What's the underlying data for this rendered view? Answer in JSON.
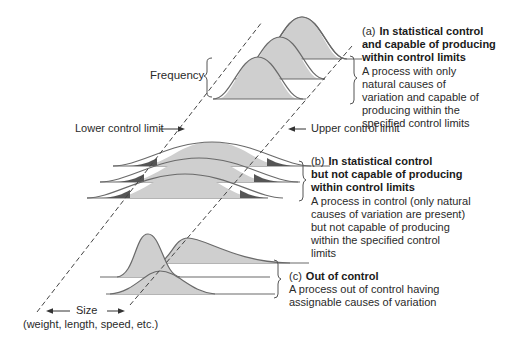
{
  "diagram": {
    "frequency_label": "Frequency",
    "lower_limit_label": "Lower control limit",
    "upper_limit_label": "Upper control limit",
    "size_label": "Size",
    "size_sublabel": "(weight, length, speed, etc.)",
    "colors": {
      "curve_fill": "#cfcfcf",
      "curve_stroke": "#6a6a6a",
      "tail_fill": "#555555",
      "dashed_line": "#444444",
      "text": "#2a2a2a"
    }
  },
  "cases": [
    {
      "tag": "(a)",
      "title": "In statistical control and capable of producing within control limits",
      "title_lines": [
        "In statistical control",
        "and capable of producing",
        "within control limits"
      ],
      "description_lines": [
        "A process with only",
        "natural causes of",
        "variation and capable of",
        "producing within the",
        "specified control limits"
      ]
    },
    {
      "tag": "(b)",
      "title": "In statistical control but not capable of producing within control limits",
      "title_lines": [
        "In statistical control",
        "but not capable of producing",
        "within control limits"
      ],
      "description_lines": [
        "A process in control (only natural",
        "causes of variation are present)",
        "but not capable of producing",
        "within the specified control",
        "limits"
      ]
    },
    {
      "tag": "(c)",
      "title": "Out of control",
      "title_lines": [
        "Out of control"
      ],
      "description_lines": [
        "A process out of control having",
        "assignable causes of variation"
      ]
    }
  ]
}
